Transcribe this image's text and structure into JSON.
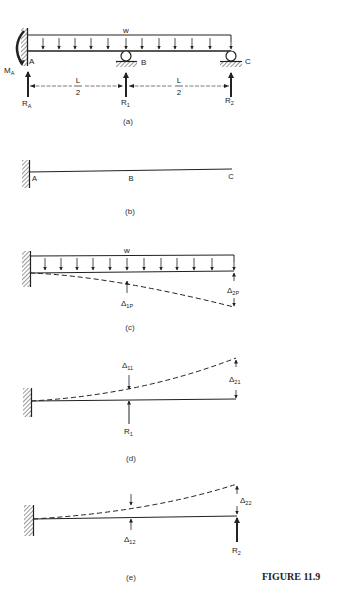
{
  "figure_label": "FIGURE 11.9",
  "panels": {
    "a": {
      "caption": "(a)",
      "load_label": "w",
      "moment_label": "M",
      "moment_sub": "A",
      "point_a": "A",
      "point_b": "B",
      "point_c": "C",
      "reaction_a": "R",
      "reaction_a_sub": "A",
      "reaction_1": "R",
      "reaction_1_sub": "1",
      "reaction_2": "R",
      "reaction_2_sub": "2",
      "span_1_num": "L",
      "span_1_den": "2",
      "span_2_num": "L",
      "span_2_den": "2"
    },
    "b": {
      "caption": "(b)",
      "point_a": "A",
      "point_b": "B",
      "point_c": "C"
    },
    "c": {
      "caption": "(c)",
      "load_label": "w",
      "delta_1p": "Δ",
      "delta_1p_sub": "1P",
      "delta_2p": "Δ",
      "delta_2p_sub": "2P"
    },
    "d": {
      "caption": "(d)",
      "delta_11": "Δ",
      "delta_11_sub": "11",
      "delta_21": "Δ",
      "delta_21_sub": "21",
      "reaction": "R",
      "reaction_sub": "1"
    },
    "e": {
      "caption": "(e)",
      "delta_12": "Δ",
      "delta_12_sub": "12",
      "delta_22": "Δ",
      "delta_22_sub": "22",
      "reaction": "R",
      "reaction_sub": "2"
    }
  }
}
